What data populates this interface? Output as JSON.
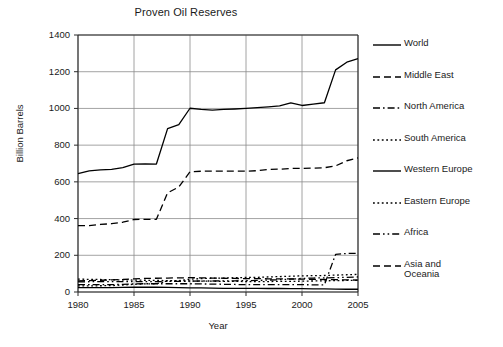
{
  "chart_data": {
    "type": "line",
    "title": "Proven Oil Reserves",
    "xlabel": "Year",
    "ylabel": "Billion Barrels",
    "xlim": [
      1980,
      2005
    ],
    "ylim": [
      0,
      1400
    ],
    "xticks": [
      1980,
      1985,
      1990,
      1995,
      2000,
      2005
    ],
    "yticks": [
      0,
      200,
      400,
      600,
      800,
      1000,
      1200,
      1400
    ],
    "grid": true,
    "legend_position": "right",
    "x": [
      1980,
      1981,
      1982,
      1983,
      1984,
      1985,
      1986,
      1987,
      1988,
      1989,
      1990,
      1991,
      1992,
      1993,
      1994,
      1995,
      1996,
      1997,
      1998,
      1999,
      2000,
      2001,
      2002,
      2003,
      2004,
      2005
    ],
    "series": [
      {
        "name": "World",
        "style": "solid",
        "color": "#000000",
        "values": [
          645,
          660,
          665,
          668,
          678,
          697,
          698,
          697,
          890,
          912,
          1001,
          995,
          991,
          995,
          997,
          1000,
          1004,
          1009,
          1014,
          1030,
          1016,
          1024,
          1031,
          1210,
          1252,
          1271
        ]
      },
      {
        "name": "Middle East",
        "style": "dashed",
        "color": "#000000",
        "values": [
          362,
          362,
          368,
          372,
          380,
          395,
          396,
          396,
          540,
          572,
          655,
          658,
          659,
          659,
          659,
          658,
          661,
          668,
          669,
          673,
          673,
          675,
          677,
          687,
          715,
          730
        ]
      },
      {
        "name": "North America",
        "style": "dashdot",
        "color": "#000000",
        "values": [
          40,
          40,
          40,
          40,
          42,
          44,
          45,
          45,
          45,
          45,
          45,
          44,
          43,
          42,
          41,
          40,
          40,
          40,
          40,
          40,
          40,
          39,
          39,
          205,
          210,
          211
        ]
      },
      {
        "name": "South America",
        "style": "dotted",
        "color": "#000000",
        "values": [
          33,
          33,
          34,
          35,
          38,
          42,
          44,
          45,
          60,
          62,
          70,
          73,
          75,
          76,
          78,
          79,
          80,
          82,
          84,
          86,
          88,
          89,
          90,
          92,
          94,
          96
        ]
      },
      {
        "name": "Western Europe",
        "style": "solid",
        "color": "#000000",
        "values": [
          24,
          24,
          24,
          24,
          25,
          26,
          26,
          26,
          25,
          24,
          23,
          22,
          21,
          20,
          20,
          20,
          20,
          19,
          19,
          18,
          18,
          17,
          17,
          16,
          15,
          15
        ]
      },
      {
        "name": "Eastern Europe",
        "style": "dotted",
        "color": "#000000",
        "values": [
          70,
          69,
          68,
          67,
          66,
          65,
          64,
          63,
          62,
          61,
          60,
          59,
          59,
          58,
          58,
          57,
          57,
          57,
          58,
          58,
          59,
          60,
          61,
          62,
          63,
          64
        ]
      },
      {
        "name": "Africa",
        "style": "dashdotdot",
        "color": "#000000",
        "values": [
          55,
          56,
          56,
          57,
          57,
          57,
          56,
          56,
          58,
          58,
          59,
          60,
          60,
          61,
          61,
          62,
          63,
          65,
          67,
          70,
          74,
          76,
          77,
          78,
          80,
          82
        ]
      },
      {
        "name": "Asia and\nOceania",
        "style": "dashed",
        "color": "#000000",
        "values": [
          60,
          62,
          64,
          66,
          68,
          72,
          74,
          75,
          76,
          77,
          78,
          77,
          76,
          75,
          74,
          73,
          73,
          72,
          72,
          71,
          70,
          69,
          68,
          67,
          66,
          65
        ]
      }
    ]
  }
}
